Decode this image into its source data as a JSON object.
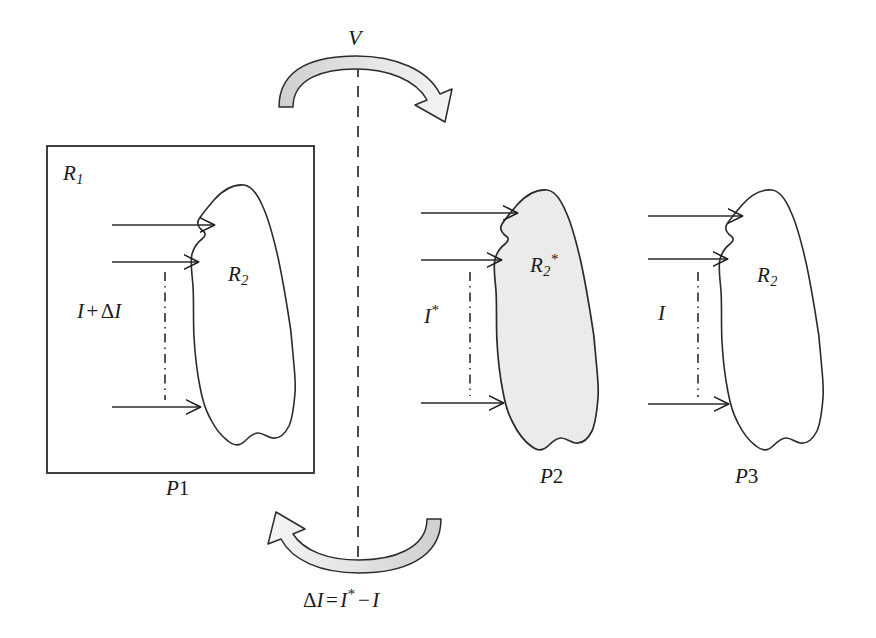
{
  "figure": {
    "title_text": "",
    "colors": {
      "stroke": "#1a1a1a",
      "blob_fill_plain": "#ffffff",
      "blob_fill_shaded": "#ececec",
      "arrow_ribbon_fill": "#d4d4d4",
      "arrow_head_fill": "#f2f2f2",
      "background": "#ffffff"
    }
  },
  "rotation": {
    "top_arrow_label": "V",
    "top_arrow_icon": "curved-arrow-clockwise-icon",
    "bottom_arrow_icon": "curved-arrow-counterclockwise-icon",
    "bottom_equation": {
      "lhs_delta": "Δ",
      "lhs_var": "I",
      "equals": "=",
      "rhs_var": "I",
      "rhs_star": "*",
      "minus": "−",
      "rhs_var2": "I",
      "plain": "ΔI = I* − I"
    },
    "axis_icon": "vertical-dashed-axis-icon"
  },
  "panels": [
    {
      "id": "p1",
      "label": "P",
      "label_num": "1",
      "has_box": true,
      "box_label": "R",
      "box_label_sub": "1",
      "blob_label": "R",
      "blob_label_sub": "2",
      "blob_label_sup": "",
      "blob_shaded": false,
      "flux_label": {
        "var1": "I",
        "op": "+",
        "delta": "Δ",
        "var2": "I",
        "star": "",
        "plain": "I + ΔI"
      },
      "arrow_count": 3,
      "dashdot_icon": "vertical-dash-dot-line-icon"
    },
    {
      "id": "p2",
      "label": "P",
      "label_num": "2",
      "has_box": false,
      "box_label": "",
      "box_label_sub": "",
      "blob_label": "R",
      "blob_label_sub": "2",
      "blob_label_sup": "*",
      "blob_shaded": true,
      "flux_label": {
        "var1": "I",
        "op": "",
        "delta": "",
        "var2": "",
        "star": "*",
        "plain": "I*"
      },
      "arrow_count": 3,
      "dashdot_icon": "vertical-dash-dot-line-icon"
    },
    {
      "id": "p3",
      "label": "P",
      "label_num": "3",
      "has_box": false,
      "box_label": "",
      "box_label_sub": "",
      "blob_label": "R",
      "blob_label_sub": "2",
      "blob_label_sup": "",
      "blob_shaded": false,
      "flux_label": {
        "var1": "I",
        "op": "",
        "delta": "",
        "var2": "",
        "star": "",
        "plain": "I"
      },
      "arrow_count": 3,
      "dashdot_icon": "vertical-dash-dot-line-icon"
    }
  ]
}
